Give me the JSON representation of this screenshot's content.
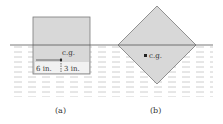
{
  "figure": {
    "panel_a": {
      "caption": "(a)",
      "cg_label": "c.g.",
      "dim_horizontal": "6 in.",
      "dim_vertical": "3 in."
    },
    "panel_b": {
      "caption": "(b)",
      "cg_label": "c.g."
    }
  },
  "colors": {
    "block_fill": "#d8d8d8",
    "block_stroke": "#7a7a7a",
    "water_line": "#555555",
    "water_hatch": "#b8b8b8",
    "text": "#333333"
  }
}
